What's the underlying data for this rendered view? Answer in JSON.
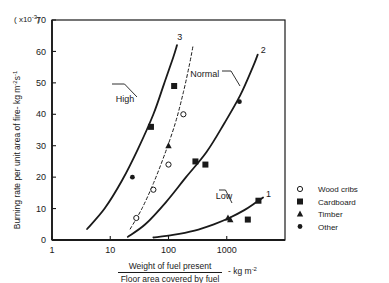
{
  "figure": {
    "background": "#ffffff",
    "ink": "#1a1a1a"
  },
  "chart_data": {
    "type": "line",
    "title": "",
    "subtitle": "",
    "xlabel_numerator": "Weight of fuel present",
    "xlabel_denominator": "Floor area covered by fuel",
    "xlabel_units": "- kg m",
    "xlabel_units_exponent": "-2",
    "ylabel": "Burning rate per unit area of fire- kg m",
    "ylabel_exponent_1": "-2",
    "ylabel_exponent_2": "-1",
    "ylabel_exponent_tail": "s",
    "y_scale_prefix": "( x10",
    "y_scale_exponent": "-3",
    "y_scale_suffix": ")",
    "xscale": "log",
    "yscale": "linear",
    "xlim": [
      1,
      10000
    ],
    "ylim": [
      0,
      70
    ],
    "grid": false,
    "legend_position": "right-outside",
    "xticks": [
      1,
      10,
      100,
      1000
    ],
    "xtick_labels": [
      "1",
      "10",
      "100",
      "1000"
    ],
    "yticks": [
      0,
      10,
      20,
      30,
      40,
      50,
      60,
      70
    ],
    "ytick_labels": [
      "0",
      "10",
      "20",
      "30",
      "40",
      "50",
      "60",
      "70"
    ],
    "annotations": [
      {
        "text": "High",
        "x": 18,
        "y": 44
      },
      {
        "text": "Normal",
        "x": 420,
        "y": 52
      },
      {
        "text": "Low",
        "x": 900,
        "y": 13
      }
    ],
    "curve_tags": [
      {
        "text": "3",
        "x": 125,
        "y": 63
      },
      {
        "text": "2",
        "x": 3400,
        "y": 59
      },
      {
        "text": "1",
        "x": 4200,
        "y": 13
      }
    ],
    "series": [
      {
        "name": "High",
        "tag": "3",
        "style": "solid",
        "points": [
          {
            "x": 4,
            "y": 3.5
          },
          {
            "x": 8,
            "y": 10
          },
          {
            "x": 16,
            "y": 19
          },
          {
            "x": 30,
            "y": 29
          },
          {
            "x": 55,
            "y": 40
          },
          {
            "x": 85,
            "y": 50
          },
          {
            "x": 120,
            "y": 58
          },
          {
            "x": 140,
            "y": 62
          }
        ]
      },
      {
        "name": "Intermediate (dashed)",
        "tag": "",
        "style": "dashed",
        "points": [
          {
            "x": 22,
            "y": 3.5
          },
          {
            "x": 35,
            "y": 10
          },
          {
            "x": 55,
            "y": 18
          },
          {
            "x": 85,
            "y": 27
          },
          {
            "x": 130,
            "y": 37
          },
          {
            "x": 180,
            "y": 47
          },
          {
            "x": 230,
            "y": 56
          },
          {
            "x": 265,
            "y": 62
          }
        ]
      },
      {
        "name": "Normal",
        "tag": "2",
        "style": "solid",
        "points": [
          {
            "x": 20,
            "y": 1
          },
          {
            "x": 40,
            "y": 5
          },
          {
            "x": 90,
            "y": 12
          },
          {
            "x": 200,
            "y": 20
          },
          {
            "x": 450,
            "y": 28
          },
          {
            "x": 900,
            "y": 37
          },
          {
            "x": 1700,
            "y": 46
          },
          {
            "x": 2800,
            "y": 55
          },
          {
            "x": 3400,
            "y": 59
          }
        ]
      },
      {
        "name": "Low",
        "tag": "1",
        "style": "solid",
        "points": [
          {
            "x": 55,
            "y": 0.8
          },
          {
            "x": 120,
            "y": 1.6
          },
          {
            "x": 280,
            "y": 3
          },
          {
            "x": 600,
            "y": 5
          },
          {
            "x": 1100,
            "y": 7
          },
          {
            "x": 2000,
            "y": 9.5
          },
          {
            "x": 3200,
            "y": 12
          },
          {
            "x": 4200,
            "y": 13.5
          }
        ]
      }
    ],
    "markers": [
      {
        "x": 24,
        "y": 20,
        "symbol": "other"
      },
      {
        "x": 50,
        "y": 36,
        "symbol": "cardboard"
      },
      {
        "x": 125,
        "y": 49,
        "symbol": "cardboard"
      },
      {
        "x": 100,
        "y": 30,
        "symbol": "timber"
      },
      {
        "x": 180,
        "y": 40,
        "symbol": "wood-cribs"
      },
      {
        "x": 100,
        "y": 24,
        "symbol": "wood-cribs"
      },
      {
        "x": 55,
        "y": 16,
        "symbol": "wood-cribs"
      },
      {
        "x": 28,
        "y": 7,
        "symbol": "wood-cribs"
      },
      {
        "x": 290,
        "y": 25,
        "symbol": "cardboard"
      },
      {
        "x": 430,
        "y": 24,
        "symbol": "cardboard"
      },
      {
        "x": 1650,
        "y": 44,
        "symbol": "other"
      },
      {
        "x": 1050,
        "y": 7,
        "symbol": "timber"
      },
      {
        "x": 1150,
        "y": 6.5,
        "symbol": "timber"
      },
      {
        "x": 2300,
        "y": 6.5,
        "symbol": "cardboard"
      },
      {
        "x": 3500,
        "y": 12.5,
        "symbol": "cardboard"
      }
    ],
    "legend": [
      {
        "symbol": "wood-cribs",
        "label": "Wood cribs"
      },
      {
        "symbol": "cardboard",
        "label": "Cardboard"
      },
      {
        "symbol": "timber",
        "label": "Timber"
      },
      {
        "symbol": "other",
        "label": "Other"
      }
    ]
  }
}
